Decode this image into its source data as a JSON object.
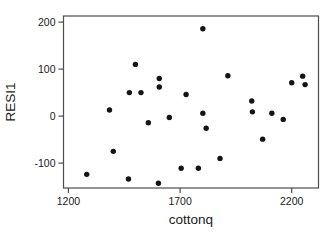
{
  "chart": {
    "xlabel": "cottonq",
    "ylabel": "RESI1"
  },
  "colors": {
    "background": "#ffffff",
    "plot_border": "#4d4d4d",
    "tick": "#4d4d4d",
    "point": "#141414",
    "text": "#1a1a1a"
  },
  "chart_data": {
    "type": "scatter",
    "title": "",
    "xlabel": "cottonq",
    "ylabel": "RESI1",
    "xlim": [
      1178,
      2320
    ],
    "ylim": [
      -153,
      213
    ],
    "x_ticks": [
      1200,
      1700,
      2200
    ],
    "y_ticks": [
      -100,
      0,
      100,
      200
    ],
    "grid": false,
    "legend": false,
    "points": [
      [
        1282,
        -124
      ],
      [
        1384,
        13
      ],
      [
        1401,
        -75
      ],
      [
        1469,
        -134
      ],
      [
        1473,
        50
      ],
      [
        1500,
        110
      ],
      [
        1525,
        50
      ],
      [
        1558,
        -14
      ],
      [
        1603,
        -143
      ],
      [
        1607,
        80
      ],
      [
        1607,
        62
      ],
      [
        1652,
        -3
      ],
      [
        1705,
        -111
      ],
      [
        1727,
        46
      ],
      [
        1782,
        -111
      ],
      [
        1802,
        186
      ],
      [
        1802,
        6
      ],
      [
        1817,
        -26
      ],
      [
        1879,
        -90
      ],
      [
        1914,
        86
      ],
      [
        2021,
        32
      ],
      [
        2024,
        9
      ],
      [
        2070,
        -49
      ],
      [
        2111,
        6
      ],
      [
        2162,
        -7
      ],
      [
        2200,
        71
      ],
      [
        2249,
        85
      ],
      [
        2260,
        67
      ]
    ]
  }
}
